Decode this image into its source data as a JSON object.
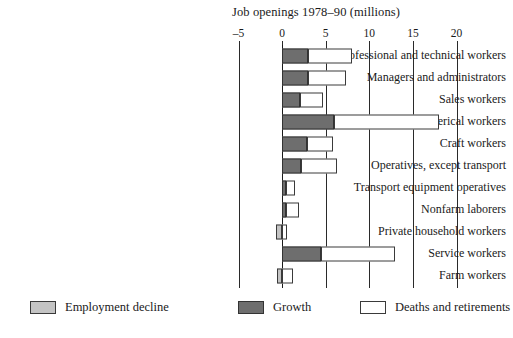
{
  "chart_data": {
    "type": "bar",
    "orientation": "horizontal",
    "stacked": true,
    "title": "Job openings 1978–90 (millions)",
    "xlabel": "",
    "ylabel": "",
    "xlim": [
      -5,
      20
    ],
    "xticks": [
      -5,
      0,
      5,
      10,
      15,
      20
    ],
    "xtick_labels": [
      "–5",
      "0",
      "5",
      "10",
      "15",
      "20"
    ],
    "grid": "vertical gridlines at every tick",
    "legend_position": "bottom",
    "categories": [
      "Professional and technical workers",
      "Managers and administrators",
      "Sales workers",
      "Clerical workers",
      "Craft workers",
      "Operatives, except transport",
      "Transport equipment operatives",
      "Nonfarm laborers",
      "Private household workers",
      "Service workers",
      "Farm workers"
    ],
    "series": [
      {
        "name": "Employment decline",
        "color": "#c4c4c4",
        "values": [
          0,
          0,
          0,
          0,
          0,
          0,
          0,
          0,
          -0.7,
          0,
          -0.6
        ]
      },
      {
        "name": "Growth",
        "color": "#6e6e6e",
        "values": [
          3.0,
          3.0,
          2.0,
          6.0,
          2.8,
          2.2,
          0.5,
          0.4,
          0,
          4.5,
          0
        ]
      },
      {
        "name": "Deaths and retirements",
        "color": "#ffffff",
        "values": [
          5.0,
          4.3,
          2.7,
          12.0,
          3.0,
          4.1,
          1.0,
          1.5,
          0.6,
          8.5,
          1.3
        ]
      }
    ]
  },
  "legend": {
    "items": [
      {
        "label": "Employment decline",
        "swatch": "decline"
      },
      {
        "label": "Growth",
        "swatch": "growth"
      },
      {
        "label": "Deaths and retirements",
        "swatch": "deaths"
      }
    ]
  }
}
